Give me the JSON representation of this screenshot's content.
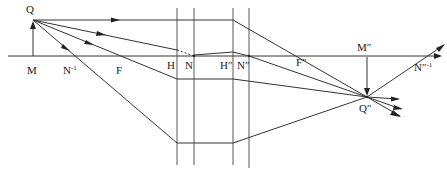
{
  "diagram": {
    "type": "optical-ray-diagram",
    "labels": {
      "object_top": "Q",
      "object_base": "M",
      "front_nodal_virtual": "N",
      "front_nodal_virtual_sup": "-1",
      "front_focal": "F",
      "front_principal": "H",
      "front_nodal": "N",
      "rear_principal": "H″",
      "rear_nodal": "N″",
      "rear_focal": "F″",
      "image_base": "M″",
      "image_top": "Q″",
      "rear_nodal_virtual": "N″",
      "rear_nodal_virtual_sup": "-1"
    },
    "colors": {
      "line": "#333333",
      "background": "#ffffff"
    }
  }
}
